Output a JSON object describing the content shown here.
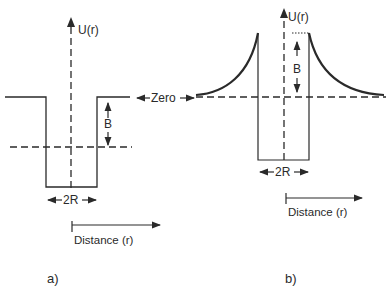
{
  "panel_a": {
    "caption": "a)",
    "y_axis_label": "U(r)",
    "barrier_label": "B",
    "width_label": "2R",
    "x_axis_label": "Distance (r)",
    "shape": "square well"
  },
  "shared": {
    "zero_label": "Zero"
  },
  "panel_b": {
    "caption": "b)",
    "y_axis_label": "U(r)",
    "barrier_label": "B",
    "width_label": "2R",
    "x_axis_label": "Distance (r)",
    "shape": "square well with Coulomb barrier"
  },
  "colors": {
    "line": "#2a2a2a",
    "background": "#ffffff"
  }
}
